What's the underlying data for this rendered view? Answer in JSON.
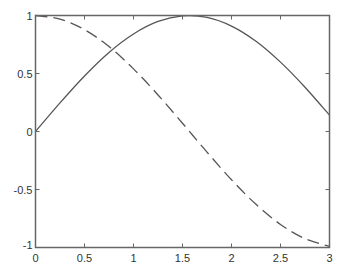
{
  "chart_data": {
    "type": "line",
    "title": "",
    "xlabel": "",
    "ylabel": "",
    "xlim": [
      0,
      3
    ],
    "ylim": [
      -1,
      1
    ],
    "grid": false,
    "legend": null,
    "x_ticks": [
      0,
      0.5,
      1,
      1.5,
      2,
      2.5,
      3
    ],
    "x_tick_labels": [
      "0",
      "0.5",
      "1",
      "1.5",
      "2",
      "2.5",
      "3"
    ],
    "y_ticks": [
      -1,
      -0.5,
      0,
      0.5,
      1
    ],
    "y_tick_labels": [
      "-1",
      "-0.5",
      "0",
      "0.5",
      "1"
    ],
    "x": [
      0,
      0.25,
      0.5,
      0.75,
      1,
      1.25,
      1.5,
      1.75,
      2,
      2.25,
      2.5,
      2.75,
      3
    ],
    "series": [
      {
        "name": "sin(x)",
        "style": "solid",
        "color": "#555555",
        "values": [
          0,
          0.247,
          0.479,
          0.682,
          0.841,
          0.949,
          0.997,
          0.984,
          0.909,
          0.778,
          0.598,
          0.382,
          0.141
        ]
      },
      {
        "name": "cos(x)",
        "style": "dashed",
        "color": "#555555",
        "values": [
          1,
          0.969,
          0.878,
          0.732,
          0.54,
          0.315,
          0.071,
          -0.178,
          -0.416,
          -0.628,
          -0.801,
          -0.924,
          -0.99
        ]
      }
    ]
  },
  "colors": {
    "axes": "#666666",
    "text": "#333333",
    "background": "#ffffff"
  }
}
